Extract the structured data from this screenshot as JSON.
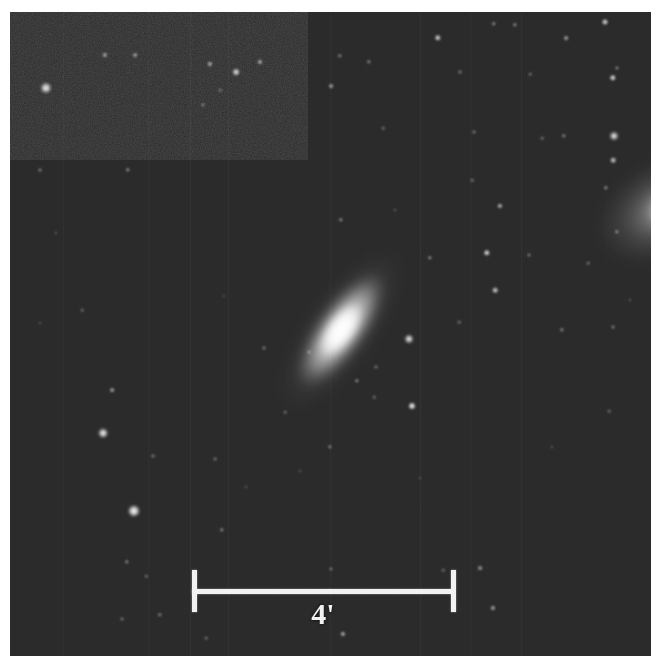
{
  "figure": {
    "kind": "astronomical-sky-image",
    "medium": "grayscale photographic plate",
    "border_color": "#ffffff",
    "sky_color": "#2b2b2b"
  },
  "scalebar": {
    "label": "4'",
    "unit": "arcminutes",
    "value": 4,
    "color": "#f2f2f2",
    "x_start_px": 192,
    "x_end_px": 455,
    "y_px": 591,
    "tick_top_px": 570,
    "tick_bottom_px": 612,
    "label_x_px": 323,
    "label_y_px": 597
  },
  "objects": [
    {
      "name": "main-galaxy",
      "type": "galaxy",
      "morphology": "inclined lenticular / early-type spiral",
      "x": 331,
      "y": 318,
      "major_axis_px": 190,
      "minor_axis_px": 74,
      "position_angle_deg": -55,
      "peak_brightness": 1.0
    },
    {
      "name": "companion-galaxy",
      "type": "galaxy",
      "morphology": "bright diffuse source clipped by frame edge",
      "x": 658,
      "y": 196,
      "major_axis_px": 150,
      "minor_axis_px": 96,
      "position_angle_deg": -28,
      "peak_brightness": 0.95
    }
  ],
  "stars": [
    {
      "x": 46,
      "y": 88,
      "r": 5.0,
      "b": 0.92
    },
    {
      "x": 105,
      "y": 55,
      "r": 2.6,
      "b": 0.6
    },
    {
      "x": 135,
      "y": 55,
      "r": 2.4,
      "b": 0.55
    },
    {
      "x": 128,
      "y": 170,
      "r": 2.2,
      "b": 0.5
    },
    {
      "x": 40,
      "y": 170,
      "r": 2.0,
      "b": 0.42
    },
    {
      "x": 236,
      "y": 72,
      "r": 3.4,
      "b": 0.8
    },
    {
      "x": 210,
      "y": 64,
      "r": 2.6,
      "b": 0.62
    },
    {
      "x": 260,
      "y": 62,
      "r": 2.6,
      "b": 0.62
    },
    {
      "x": 203,
      "y": 105,
      "r": 2.0,
      "b": 0.4
    },
    {
      "x": 220,
      "y": 90,
      "r": 1.8,
      "b": 0.35
    },
    {
      "x": 331,
      "y": 86,
      "r": 2.4,
      "b": 0.55
    },
    {
      "x": 340,
      "y": 56,
      "r": 2.2,
      "b": 0.45
    },
    {
      "x": 369,
      "y": 62,
      "r": 2.2,
      "b": 0.45
    },
    {
      "x": 438,
      "y": 38,
      "r": 3.2,
      "b": 0.75
    },
    {
      "x": 460,
      "y": 72,
      "r": 2.0,
      "b": 0.4
    },
    {
      "x": 494,
      "y": 24,
      "r": 2.2,
      "b": 0.48
    },
    {
      "x": 515,
      "y": 25,
      "r": 2.2,
      "b": 0.48
    },
    {
      "x": 605,
      "y": 22,
      "r": 3.0,
      "b": 0.78
    },
    {
      "x": 613,
      "y": 78,
      "r": 3.2,
      "b": 0.8
    },
    {
      "x": 614,
      "y": 136,
      "r": 4.0,
      "b": 0.9
    },
    {
      "x": 613,
      "y": 160,
      "r": 2.8,
      "b": 0.7
    },
    {
      "x": 606,
      "y": 188,
      "r": 2.2,
      "b": 0.5
    },
    {
      "x": 617,
      "y": 68,
      "r": 2.0,
      "b": 0.42
    },
    {
      "x": 566,
      "y": 38,
      "r": 2.4,
      "b": 0.55
    },
    {
      "x": 564,
      "y": 136,
      "r": 2.2,
      "b": 0.45
    },
    {
      "x": 542,
      "y": 138,
      "r": 1.8,
      "b": 0.35
    },
    {
      "x": 474,
      "y": 132,
      "r": 2.0,
      "b": 0.38
    },
    {
      "x": 472,
      "y": 180,
      "r": 1.8,
      "b": 0.35
    },
    {
      "x": 530,
      "y": 74,
      "r": 1.8,
      "b": 0.33
    },
    {
      "x": 383,
      "y": 128,
      "r": 1.8,
      "b": 0.33
    },
    {
      "x": 341,
      "y": 220,
      "r": 2.2,
      "b": 0.48
    },
    {
      "x": 395,
      "y": 210,
      "r": 1.6,
      "b": 0.3
    },
    {
      "x": 430,
      "y": 258,
      "r": 2.2,
      "b": 0.48
    },
    {
      "x": 459,
      "y": 322,
      "r": 1.8,
      "b": 0.35
    },
    {
      "x": 309,
      "y": 352,
      "r": 2.0,
      "b": 0.4
    },
    {
      "x": 409,
      "y": 339,
      "r": 4.0,
      "b": 0.92
    },
    {
      "x": 412,
      "y": 406,
      "r": 3.5,
      "b": 0.88
    },
    {
      "x": 357,
      "y": 381,
      "r": 2.2,
      "b": 0.48
    },
    {
      "x": 487,
      "y": 253,
      "r": 3.2,
      "b": 0.8
    },
    {
      "x": 495,
      "y": 290,
      "r": 2.8,
      "b": 0.72
    },
    {
      "x": 500,
      "y": 206,
      "r": 2.6,
      "b": 0.66
    },
    {
      "x": 529,
      "y": 255,
      "r": 2.0,
      "b": 0.38
    },
    {
      "x": 562,
      "y": 330,
      "r": 2.2,
      "b": 0.46
    },
    {
      "x": 617,
      "y": 232,
      "r": 2.2,
      "b": 0.46
    },
    {
      "x": 613,
      "y": 327,
      "r": 2.0,
      "b": 0.4
    },
    {
      "x": 588,
      "y": 263,
      "r": 1.8,
      "b": 0.35
    },
    {
      "x": 330,
      "y": 447,
      "r": 2.2,
      "b": 0.44
    },
    {
      "x": 285,
      "y": 412,
      "r": 1.8,
      "b": 0.32
    },
    {
      "x": 103,
      "y": 433,
      "r": 4.4,
      "b": 0.94
    },
    {
      "x": 112,
      "y": 390,
      "r": 2.4,
      "b": 0.55
    },
    {
      "x": 134,
      "y": 511,
      "r": 5.6,
      "b": 0.98
    },
    {
      "x": 153,
      "y": 456,
      "r": 2.0,
      "b": 0.4
    },
    {
      "x": 215,
      "y": 459,
      "r": 2.0,
      "b": 0.38
    },
    {
      "x": 222,
      "y": 530,
      "r": 2.2,
      "b": 0.46
    },
    {
      "x": 127,
      "y": 562,
      "r": 2.2,
      "b": 0.46
    },
    {
      "x": 146,
      "y": 576,
      "r": 1.8,
      "b": 0.33
    },
    {
      "x": 122,
      "y": 619,
      "r": 2.0,
      "b": 0.38
    },
    {
      "x": 160,
      "y": 615,
      "r": 2.2,
      "b": 0.44
    },
    {
      "x": 206,
      "y": 638,
      "r": 1.8,
      "b": 0.32
    },
    {
      "x": 343,
      "y": 634,
      "r": 2.6,
      "b": 0.62
    },
    {
      "x": 330,
      "y": 590,
      "r": 1.6,
      "b": 0.28
    },
    {
      "x": 374,
      "y": 397,
      "r": 1.8,
      "b": 0.32
    },
    {
      "x": 376,
      "y": 367,
      "r": 2.0,
      "b": 0.36
    },
    {
      "x": 480,
      "y": 568,
      "r": 2.4,
      "b": 0.52
    },
    {
      "x": 493,
      "y": 608,
      "r": 2.6,
      "b": 0.58
    },
    {
      "x": 331,
      "y": 569,
      "r": 2.0,
      "b": 0.36
    },
    {
      "x": 443,
      "y": 570,
      "r": 1.8,
      "b": 0.32
    },
    {
      "x": 609,
      "y": 411,
      "r": 1.8,
      "b": 0.32
    },
    {
      "x": 630,
      "y": 300,
      "r": 1.6,
      "b": 0.28
    },
    {
      "x": 82,
      "y": 310,
      "r": 1.8,
      "b": 0.3
    },
    {
      "x": 40,
      "y": 323,
      "r": 1.6,
      "b": 0.26
    },
    {
      "x": 56,
      "y": 233,
      "r": 1.6,
      "b": 0.26
    },
    {
      "x": 246,
      "y": 487,
      "r": 1.6,
      "b": 0.26
    },
    {
      "x": 264,
      "y": 348,
      "r": 2.0,
      "b": 0.4
    },
    {
      "x": 300,
      "y": 471,
      "r": 1.6,
      "b": 0.26
    },
    {
      "x": 224,
      "y": 296,
      "r": 1.6,
      "b": 0.24
    },
    {
      "x": 552,
      "y": 447,
      "r": 1.6,
      "b": 0.26
    },
    {
      "x": 420,
      "y": 478,
      "r": 1.6,
      "b": 0.24
    }
  ],
  "stripe_columns": [
    {
      "x": 190,
      "o": 0.05
    },
    {
      "x": 228,
      "o": 0.045
    },
    {
      "x": 330,
      "o": 0.04
    },
    {
      "x": 420,
      "o": 0.05
    },
    {
      "x": 470,
      "o": 0.04
    },
    {
      "x": 521,
      "o": 0.045
    },
    {
      "x": 63,
      "o": 0.035
    },
    {
      "x": 148,
      "o": 0.035
    }
  ]
}
